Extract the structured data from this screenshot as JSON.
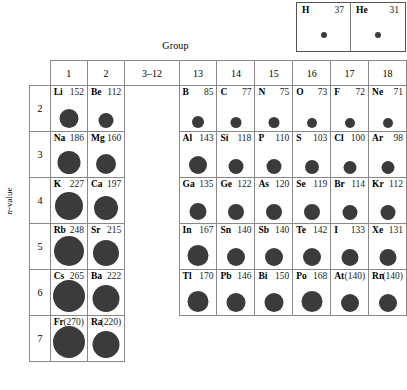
{
  "figure": {
    "group_caption": "Group",
    "nvalue_caption_prefix": "n",
    "nvalue_caption_suffix": "-value"
  },
  "group_headers": [
    "1",
    "2",
    "3–12",
    "13",
    "14",
    "15",
    "16",
    "17",
    "18"
  ],
  "periods": [
    "2",
    "3",
    "4",
    "5",
    "6",
    "7"
  ],
  "top_block": [
    {
      "symbol": "H",
      "value": "37",
      "radius": 37
    },
    {
      "symbol": "He",
      "value": "31",
      "radius": 31
    }
  ],
  "rows": [
    {
      "period": "2",
      "cells": [
        {
          "symbol": "Li",
          "value": "152",
          "radius": 152
        },
        {
          "symbol": "Be",
          "value": "112",
          "radius": 112
        },
        {
          "kind": "gap"
        },
        {
          "symbol": "B",
          "value": "85",
          "radius": 85
        },
        {
          "symbol": "C",
          "value": "77",
          "radius": 77
        },
        {
          "symbol": "N",
          "value": "75",
          "radius": 75
        },
        {
          "symbol": "O",
          "value": "73",
          "radius": 73
        },
        {
          "symbol": "F",
          "value": "72",
          "radius": 72
        },
        {
          "symbol": "Ne",
          "value": "71",
          "radius": 71
        }
      ]
    },
    {
      "period": "3",
      "cells": [
        {
          "symbol": "Na",
          "value": "186",
          "radius": 186
        },
        {
          "symbol": "Mg",
          "value": "160",
          "radius": 160
        },
        {
          "kind": "gap"
        },
        {
          "symbol": "Al",
          "value": "143",
          "radius": 143
        },
        {
          "symbol": "Si",
          "value": "118",
          "radius": 118
        },
        {
          "symbol": "P",
          "value": "110",
          "radius": 110
        },
        {
          "symbol": "S",
          "value": "103",
          "radius": 103
        },
        {
          "symbol": "Cl",
          "value": "100",
          "radius": 100
        },
        {
          "symbol": "Ar",
          "value": "98",
          "radius": 98
        }
      ]
    },
    {
      "period": "4",
      "cells": [
        {
          "symbol": "K",
          "value": "227",
          "radius": 227
        },
        {
          "symbol": "Ca",
          "value": "197",
          "radius": 197
        },
        {
          "kind": "gap"
        },
        {
          "symbol": "Ga",
          "value": "135",
          "radius": 135
        },
        {
          "symbol": "Ge",
          "value": "122",
          "radius": 122
        },
        {
          "symbol": "As",
          "value": "120",
          "radius": 120
        },
        {
          "symbol": "Se",
          "value": "119",
          "radius": 119
        },
        {
          "symbol": "Br",
          "value": "114",
          "radius": 114
        },
        {
          "symbol": "Kr",
          "value": "112",
          "radius": 112
        }
      ]
    },
    {
      "period": "5",
      "cells": [
        {
          "symbol": "Rb",
          "value": "248",
          "radius": 248
        },
        {
          "symbol": "Sr",
          "value": "215",
          "radius": 215
        },
        {
          "kind": "gap"
        },
        {
          "symbol": "In",
          "value": "167",
          "radius": 167
        },
        {
          "symbol": "Sn",
          "value": "140",
          "radius": 140
        },
        {
          "symbol": "Sb",
          "value": "140",
          "radius": 140
        },
        {
          "symbol": "Te",
          "value": "142",
          "radius": 142
        },
        {
          "symbol": "I",
          "value": "133",
          "radius": 133
        },
        {
          "symbol": "Xe",
          "value": "131",
          "radius": 131
        }
      ]
    },
    {
      "period": "6",
      "cells": [
        {
          "symbol": "Cs",
          "value": "265",
          "radius": 265
        },
        {
          "symbol": "Ba",
          "value": "222",
          "radius": 222
        },
        {
          "kind": "gap"
        },
        {
          "symbol": "Tl",
          "value": "170",
          "radius": 170
        },
        {
          "symbol": "Pb",
          "value": "146",
          "radius": 146
        },
        {
          "symbol": "Bi",
          "value": "150",
          "radius": 150
        },
        {
          "symbol": "Po",
          "value": "168",
          "radius": 168
        },
        {
          "symbol": "At",
          "value": "(140)",
          "radius": 140
        },
        {
          "symbol": "Rn",
          "value": "(140)",
          "radius": 140
        }
      ]
    },
    {
      "period": "7",
      "cells": [
        {
          "symbol": "Fr",
          "value": "(270)",
          "radius": 270
        },
        {
          "symbol": "Ra",
          "value": "(220)",
          "radius": 220
        },
        {
          "kind": "none"
        },
        {
          "kind": "none"
        },
        {
          "kind": "none"
        },
        {
          "kind": "none"
        },
        {
          "kind": "none"
        },
        {
          "kind": "none"
        },
        {
          "kind": "none"
        }
      ]
    }
  ],
  "colors": {
    "dot": "#3b3b3b",
    "border": "#888888",
    "text": "#000000"
  }
}
